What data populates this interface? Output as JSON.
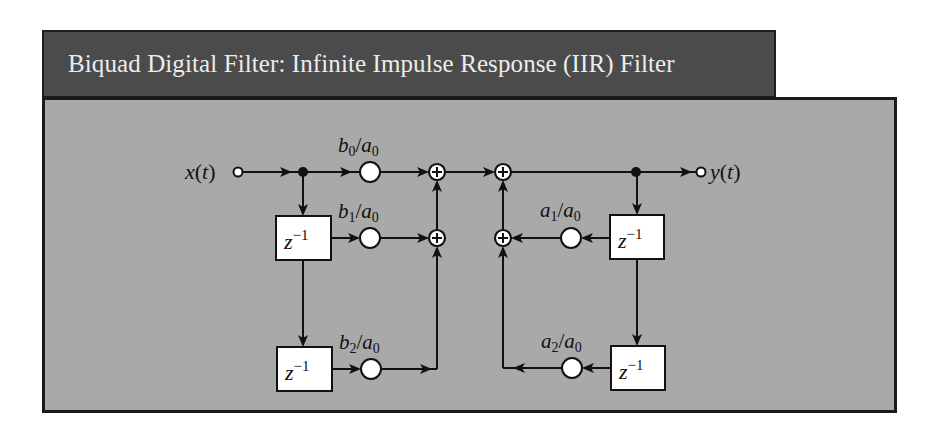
{
  "title": "Biquad Digital Filter: Infinite Impulse Response (IIR) Filter",
  "colors": {
    "title_bar": "#4b4b4b",
    "title_text": "#ececec",
    "panel": "#a9a9a9",
    "border": "#1a1a1a",
    "line": "#111111",
    "node_fill": "#ffffff"
  },
  "diagram": {
    "input": {
      "label": "x(t)",
      "var": "x",
      "arg": "t"
    },
    "output": {
      "label": "y(t)",
      "var": "y",
      "arg": "t"
    },
    "feedforward_gains": [
      {
        "label": "b0/a0",
        "num": "b",
        "num_sub": "0",
        "den": "a",
        "den_sub": "0"
      },
      {
        "label": "b1/a0",
        "num": "b",
        "num_sub": "1",
        "den": "a",
        "den_sub": "0"
      },
      {
        "label": "b2/a0",
        "num": "b",
        "num_sub": "2",
        "den": "a",
        "den_sub": "0"
      }
    ],
    "feedback_gains": [
      {
        "label": "a1/a0",
        "num": "a",
        "num_sub": "1",
        "den": "a",
        "den_sub": "0"
      },
      {
        "label": "a2/a0",
        "num": "a",
        "num_sub": "2",
        "den": "a",
        "den_sub": "0"
      }
    ],
    "delay_blocks": [
      {
        "label": "z^-1",
        "base": "z",
        "exp": "−1"
      },
      {
        "label": "z^-1",
        "base": "z",
        "exp": "−1"
      },
      {
        "label": "z^-1",
        "base": "z",
        "exp": "−1"
      },
      {
        "label": "z^-1",
        "base": "z",
        "exp": "−1"
      }
    ],
    "summing_junctions": 4,
    "sum_symbol": "+"
  }
}
